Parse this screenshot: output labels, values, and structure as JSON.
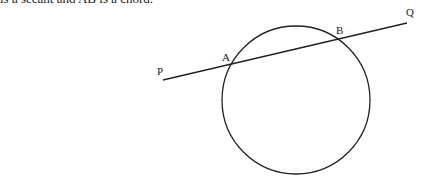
{
  "caption": "is a secant and AB is a chord.",
  "diagram": {
    "circle": {
      "cx": 296,
      "cy": 100,
      "r": 74
    },
    "line": {
      "x1": 163,
      "y1": 80,
      "x2": 407,
      "y2": 23
    },
    "labels": {
      "P": {
        "text": "P",
        "x": 157,
        "y": 75
      },
      "A": {
        "text": "A",
        "x": 222,
        "y": 61
      },
      "B": {
        "text": "B",
        "x": 336,
        "y": 34
      },
      "Q": {
        "text": "Q",
        "x": 406,
        "y": 16
      }
    },
    "stroke_color": "#222222"
  }
}
